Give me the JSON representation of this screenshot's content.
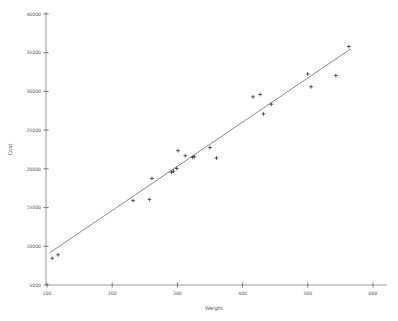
{
  "chart_data": {
    "type": "scatter",
    "title": "",
    "xlabel": "Weight",
    "ylabel": "Cost",
    "xlim": [
      90,
      612
    ],
    "ylim": [
      4200,
      40600
    ],
    "xticks": [
      100,
      200,
      300,
      400,
      500,
      600
    ],
    "yticks": [
      5000,
      10000,
      15000,
      20000,
      25000,
      30000,
      35000,
      40000
    ],
    "xtick_labels": [
      "100",
      "200",
      "300",
      "400",
      "500",
      "600"
    ],
    "ytick_labels": [
      "5000",
      "10000",
      "15000",
      "20000",
      "25000",
      "30000",
      "35000",
      "40000"
    ],
    "grid": false,
    "legend": null,
    "marker": "plus",
    "marker_color": "#2b2b2b",
    "line_color": "#3b3b3b",
    "axis_color": "#6d6d6d",
    "background": "#ffffff",
    "series": [
      {
        "name": "observations",
        "type": "scatter",
        "points": [
          [
            108,
            8450
          ],
          [
            117,
            8900
          ],
          [
            232,
            15900
          ],
          [
            257,
            16050
          ],
          [
            261,
            18750
          ],
          [
            291,
            19550
          ],
          [
            294,
            19700
          ],
          [
            299,
            20050
          ],
          [
            301,
            22350
          ],
          [
            312,
            21700
          ],
          [
            323,
            21500
          ],
          [
            326,
            21550
          ],
          [
            350,
            22750
          ],
          [
            360,
            21400
          ],
          [
            416,
            29300
          ],
          [
            427,
            29600
          ],
          [
            432,
            27100
          ],
          [
            444,
            28350
          ],
          [
            500,
            32250
          ],
          [
            505,
            30600
          ],
          [
            543,
            32050
          ],
          [
            563,
            35800
          ]
        ]
      },
      {
        "name": "regression-line",
        "type": "line",
        "endpoints": [
          [
            104,
            9150
          ],
          [
            566,
            35500
          ]
        ]
      }
    ]
  }
}
